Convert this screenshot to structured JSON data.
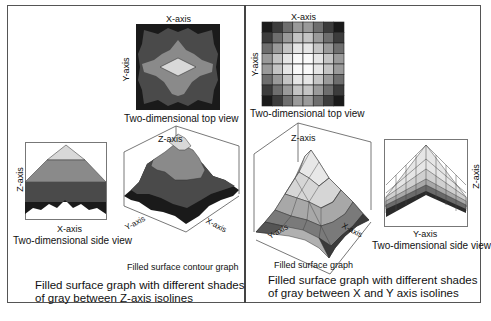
{
  "left_panel": {
    "top_view": {
      "x_axis": "X-axis",
      "y_axis": "Y-axis",
      "caption": "Two-dimensional top view"
    },
    "side_view": {
      "x_axis": "X-axis",
      "z_axis": "Z-axis",
      "caption": "Two-dimensional side view"
    },
    "surface": {
      "z_axis": "Z-axis",
      "x_axis": "X-axis",
      "y_axis": "Y-axis",
      "caption": "Filled surface contour graph"
    },
    "description_line1": "Filled surface graph with different shades",
    "description_line2": "of gray between Z-axis isolines"
  },
  "right_panel": {
    "top_view": {
      "x_axis": "X-axis",
      "y_axis": "Y-axis",
      "caption": "Two-dimensional top view"
    },
    "side_view": {
      "y_axis": "Y-axis",
      "z_axis": "Z-axis",
      "caption": "Two-dimensional side view"
    },
    "surface": {
      "z_axis": "Z-axis",
      "x_axis": "X-axis",
      "y_axis": "Y-axis",
      "caption": "Filled surface graph"
    },
    "description_line1": "Filled surface graph with different shades",
    "description_line2": "of gray between X and Y axis isolines"
  },
  "colors": {
    "level0": "#1a1a1a",
    "level1": "#4a4a4a",
    "level2": "#6e6e6e",
    "level3": "#9a9a9a",
    "level4": "#d8d8d8",
    "frame": "#555555"
  }
}
